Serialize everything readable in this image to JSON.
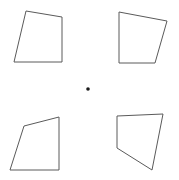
{
  "canvas": {
    "width": 179,
    "height": 180,
    "background": "#ffffff",
    "stroke_color": "#5a5a5a",
    "fill_color": "#ffffff",
    "stroke_width": 1
  },
  "figure": {
    "shape_count": 4,
    "dot_color": "#1a1a1a"
  },
  "shapes": [
    {
      "name": "quadrilateral-top-left",
      "position": "top-left",
      "points": "26,11 62,17 62,62 14,62"
    },
    {
      "name": "quadrilateral-top-right",
      "position": "top-right",
      "points": "119,12 167,21 155,63 119,63"
    },
    {
      "name": "quadrilateral-bottom-left",
      "position": "bottom-left",
      "points": "24,126 59,117 59,170 10,170"
    },
    {
      "name": "quadrilateral-bottom-right",
      "position": "bottom-right",
      "points": "117,116 163,114 152,170 117,148"
    }
  ],
  "center_dot": {
    "name": "center-dot",
    "cx": 88,
    "cy": 89,
    "r": 1.8
  }
}
